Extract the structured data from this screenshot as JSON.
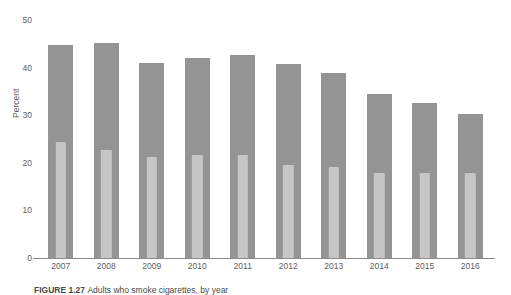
{
  "chart_data": {
    "type": "bar",
    "title": "",
    "subtitle": "",
    "xlabel": "",
    "ylabel": "Percent",
    "ylim": [
      0,
      50
    ],
    "yticks": [
      0,
      10,
      20,
      30,
      40,
      50
    ],
    "ytick_labels": [
      "0",
      "10",
      "20",
      "30",
      "40",
      "50"
    ],
    "grid": false,
    "legend_position": "none",
    "categories": [
      "2007",
      "2008",
      "2009",
      "2010",
      "2011",
      "2012",
      "2013",
      "2014",
      "2015",
      "2016"
    ],
    "series": [
      {
        "name": "outer-bar",
        "color": "#949494",
        "values": [
          44.7,
          45.2,
          41.0,
          42.0,
          42.6,
          40.8,
          38.8,
          34.5,
          32.5,
          30.3
        ]
      },
      {
        "name": "inner-bar",
        "color": "#c6c6c6",
        "values": [
          27.2,
          25.0,
          25.8,
          25.8,
          25.3,
          23.9,
          24.6,
          25.8,
          27.5,
          29.4
        ]
      }
    ]
  },
  "axis": {
    "y_title": "Percent"
  },
  "caption": {
    "label": "FIGURE 1.27",
    "text": "Adults who smoke cigarettes, by year"
  },
  "colors": {
    "outer_bar": "#949494",
    "inner_bar": "#c6c6c6",
    "axis": "#8b8b8b",
    "text": "#5d5d5d",
    "background": "#ffffff"
  }
}
